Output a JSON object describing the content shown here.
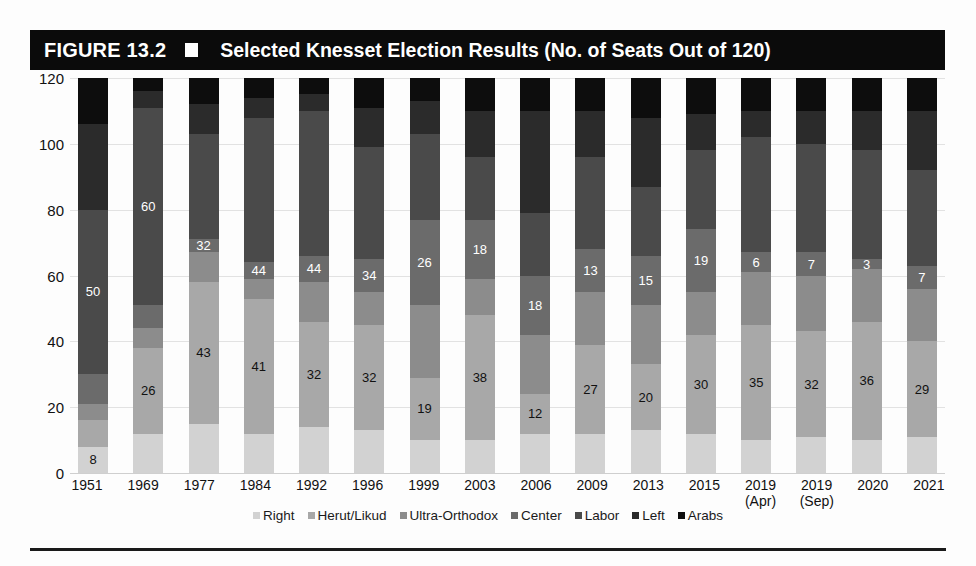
{
  "header": {
    "figure_label": "FIGURE 13.2",
    "title": "Selected Knesset Election Results (No. of Seats Out of 120)",
    "bullet_icon": "white-square-icon"
  },
  "chart_data": {
    "type": "bar",
    "stacked": true,
    "title": "Selected Knesset Election Results (No. of Seats Out of 120)",
    "xlabel": "",
    "ylabel": "",
    "ylim": [
      0,
      120
    ],
    "yticks": [
      0,
      20,
      40,
      60,
      80,
      100,
      120
    ],
    "grid": true,
    "legend_position": "bottom",
    "categories": [
      "1951",
      "1969",
      "1977",
      "1984",
      "1992",
      "1996",
      "1999",
      "2003",
      "2006",
      "2009",
      "2013",
      "2015",
      "2019 (Apr)",
      "2019 (Sep)",
      "2020",
      "2021"
    ],
    "category_lines": [
      [
        "1951",
        ""
      ],
      [
        "1969",
        ""
      ],
      [
        "1977",
        ""
      ],
      [
        "1984",
        ""
      ],
      [
        "1992",
        ""
      ],
      [
        "1996",
        ""
      ],
      [
        "1999",
        ""
      ],
      [
        "2003",
        ""
      ],
      [
        "2006",
        ""
      ],
      [
        "2009",
        ""
      ],
      [
        "2013",
        ""
      ],
      [
        "2015",
        ""
      ],
      [
        "2019",
        "(Apr)"
      ],
      [
        "2019",
        "(Sep)"
      ],
      [
        "2020",
        ""
      ],
      [
        "2021",
        ""
      ]
    ],
    "series": [
      {
        "name": "Right",
        "color": "#d2d2d2",
        "label_color": "#111111",
        "values": [
          8,
          12,
          15,
          12,
          14,
          13,
          10,
          10,
          12,
          12,
          13,
          12,
          10,
          11,
          10,
          11
        ]
      },
      {
        "name": "Herut/Likud",
        "color": "#a8a8a8",
        "label_color": "#111111",
        "values": [
          8,
          26,
          43,
          41,
          32,
          32,
          19,
          38,
          12,
          27,
          20,
          30,
          35,
          32,
          36,
          29
        ]
      },
      {
        "name": "Ultra-Orthodox",
        "color": "#8c8c8c",
        "label_color": "#111111",
        "values": [
          5,
          6,
          9,
          6,
          12,
          10,
          22,
          11,
          18,
          16,
          18,
          13,
          16,
          17,
          16,
          16
        ]
      },
      {
        "name": "Center",
        "color": "#6b6b6b",
        "label_color": "#ffffff",
        "values": [
          9,
          7,
          4,
          5,
          8,
          10,
          26,
          18,
          18,
          13,
          15,
          19,
          6,
          7,
          3,
          7
        ]
      },
      {
        "name": "Labor",
        "color": "#4a4a4a",
        "label_color": "#ffffff",
        "values": [
          50,
          60,
          32,
          44,
          44,
          34,
          26,
          19,
          19,
          28,
          21,
          24,
          35,
          33,
          33,
          29
        ]
      },
      {
        "name": "Left",
        "color": "#2b2b2b",
        "label_color": "#ffffff",
        "values": [
          26,
          5,
          9,
          6,
          5,
          12,
          10,
          14,
          31,
          14,
          21,
          11,
          8,
          10,
          12,
          18
        ]
      },
      {
        "name": "Arabs",
        "color": "#0d0d0d",
        "label_color": "#ffffff",
        "values": [
          14,
          4,
          8,
          6,
          5,
          9,
          7,
          10,
          10,
          10,
          12,
          11,
          10,
          10,
          10,
          10
        ]
      }
    ],
    "data_labels": {
      "Right": [
        8,
        null,
        null,
        null,
        null,
        null,
        null,
        null,
        null,
        null,
        null,
        null,
        null,
        null,
        null,
        null
      ],
      "Herut/Likud": [
        null,
        26,
        43,
        41,
        32,
        32,
        19,
        38,
        12,
        27,
        20,
        30,
        35,
        32,
        36,
        29
      ],
      "Center": [
        null,
        null,
        32,
        44,
        44,
        34,
        26,
        18,
        18,
        13,
        15,
        19,
        6,
        7,
        3,
        7
      ],
      "Labor": [
        50,
        60,
        null,
        null,
        null,
        null,
        null,
        null,
        null,
        null,
        null,
        null,
        null,
        null,
        null,
        null
      ]
    }
  }
}
